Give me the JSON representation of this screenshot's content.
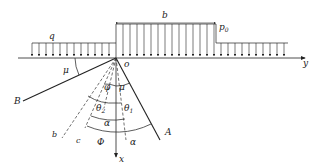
{
  "diagram": {
    "labels": {
      "q": "q",
      "b": "b",
      "p0": "p",
      "p0_sub": "0",
      "y": "y",
      "o": "o",
      "x": "x",
      "B": "B",
      "A": "A",
      "mu_left": "μ",
      "mu_right": "μ",
      "phi": "φ",
      "theta2": "θ",
      "theta2_sub": "2",
      "theta1": "θ",
      "theta1_sub": "1",
      "alpha_mid": "α",
      "alpha_right": "α",
      "Phi": "Φ",
      "b_line": "b",
      "c_line": "c"
    },
    "loads": {
      "uniform_q": "q",
      "strip_p0": "p0",
      "strip_width": "b"
    },
    "colors": {
      "line": "#222222",
      "background": "#ffffff"
    }
  }
}
